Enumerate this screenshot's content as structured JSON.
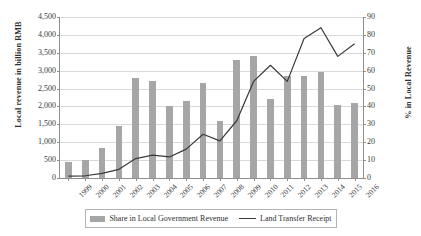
{
  "chart_data": {
    "type": "bar",
    "title": "",
    "subtitle": "",
    "xlabel": "",
    "ylabel": "Local revenue in billion RMB",
    "y2label": "% in Local Revenue",
    "categories": [
      "1999",
      "2000",
      "2001",
      "2002",
      "2003",
      "2004",
      "2005",
      "2006",
      "2007",
      "2008",
      "2009",
      "2010",
      "2011",
      "2012",
      "2013",
      "2014",
      "2015",
      "2016"
    ],
    "ylim": [
      0,
      4500
    ],
    "yticks": [
      "0",
      "500",
      "1,000",
      "1,500",
      "2,000",
      "2,500",
      "3,000",
      "3,500",
      "4,000",
      "4,500"
    ],
    "y2lim": [
      0,
      90
    ],
    "y2ticks": [
      "0",
      "10",
      "20",
      "30",
      "40",
      "50",
      "60",
      "70",
      "80",
      "90"
    ],
    "grid": true,
    "legend_position": "bottom",
    "series": [
      {
        "name": "Share in Local Government Revenue",
        "type": "bar",
        "axis": "right",
        "color": "#a6a6a6",
        "values": [
          9,
          10,
          17,
          29,
          56,
          54,
          40,
          43,
          53,
          32,
          66,
          68,
          44,
          57,
          57,
          59,
          41,
          42
        ]
      },
      {
        "name": "Land Transfer Receipt",
        "type": "line",
        "axis": "left",
        "color": "#3a3a3a",
        "values": [
          51,
          62,
          130,
          242,
          542,
          641,
          589,
          807,
          1222,
          1038,
          1600,
          2700,
          3150,
          2700,
          3900,
          4200,
          3400,
          3750
        ]
      }
    ]
  },
  "legend": {
    "bar_label": "Share in Local Government Revenue",
    "line_label": "Land Transfer Receipt"
  }
}
